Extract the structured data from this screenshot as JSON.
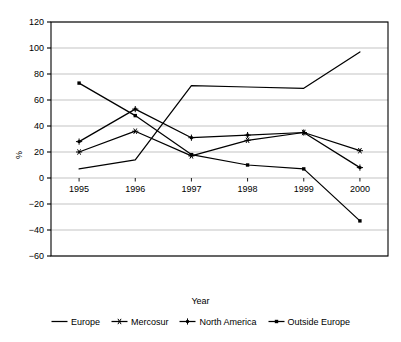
{
  "chart_data": {
    "type": "line",
    "title": "",
    "xlabel": "Year",
    "ylabel": "%",
    "categories": [
      "1995",
      "1996",
      "1997",
      "1998",
      "1999",
      "2000"
    ],
    "x": [
      1995,
      1996,
      1997,
      1998,
      1999,
      2000
    ],
    "ylim": [
      -60,
      120
    ],
    "ytick_values": [
      120,
      100,
      80,
      60,
      40,
      20,
      0,
      -20,
      -40,
      -60
    ],
    "ytick_labels": [
      "120",
      "100",
      "80",
      "60",
      "40",
      "20",
      "0",
      "−20",
      "−40",
      "−60"
    ],
    "grid": true,
    "grid_axis": "y",
    "legend_position": "bottom",
    "line_color": "#000000",
    "grid_color": "#b4b4b4",
    "axis_color": "#000000",
    "background": "#ffffff",
    "series": [
      {
        "name": "Europe",
        "marker": "none",
        "values": [
          7,
          14,
          71,
          70,
          69,
          97
        ]
      },
      {
        "name": "Mercosur",
        "marker": "asterisk",
        "values": [
          20,
          36,
          17,
          29,
          35,
          21
        ]
      },
      {
        "name": "North America",
        "marker": "star",
        "values": [
          28,
          53,
          31,
          33,
          35,
          8
        ]
      },
      {
        "name": "Outside Europe",
        "marker": "dot",
        "values": [
          73,
          48,
          18,
          10,
          7,
          -33
        ]
      }
    ]
  },
  "axis": {
    "y_label": "%",
    "x_title": "Year"
  },
  "legend": {
    "items": [
      {
        "label": "Europe",
        "marker": "line-icon"
      },
      {
        "label": "Mercosur",
        "marker": "asterisk-marker-icon"
      },
      {
        "label": "North America",
        "marker": "star-marker-icon"
      },
      {
        "label": "Outside Europe",
        "marker": "dot-marker-icon"
      }
    ]
  }
}
